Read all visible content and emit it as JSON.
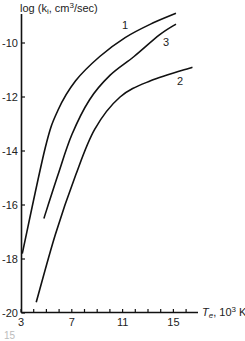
{
  "chart_data": {
    "type": "line",
    "title": "",
    "ylabel": "log (k_i, cm³/sec)",
    "ylabel_parts": {
      "pre": "log (k",
      "sub": "i",
      "mid": ", cm",
      "sup": "3",
      "post": "/sec)"
    },
    "xlabel": "T_e, 10³ K",
    "xlabel_parts": {
      "var": "T",
      "sub": "e",
      "mid": ", 10",
      "sup": "3",
      "post": " K"
    },
    "xlim": [
      3,
      17
    ],
    "ylim": [
      -20,
      -9
    ],
    "x_ticks": [
      3,
      7,
      11,
      15
    ],
    "x_tick_labels": [
      "3",
      "7",
      "11",
      "15"
    ],
    "y_ticks": [
      -10,
      -12,
      -14,
      -16,
      -18,
      -20
    ],
    "y_tick_labels": [
      "-10",
      "-12",
      "-14",
      "-16",
      "-18",
      "-20"
    ],
    "grid": false,
    "legend": "inline curve labels",
    "series": [
      {
        "name": "1",
        "x": [
          3.1,
          4.9,
          5.9,
          7.3,
          9.2,
          11.2,
          13.2,
          15.2
        ],
        "y": [
          -17.8,
          -13.9,
          -12.5,
          -11.4,
          -10.5,
          -9.8,
          -9.3,
          -8.9
        ]
      },
      {
        "name": "3",
        "x": [
          4.8,
          5.9,
          7.0,
          8.4,
          10.0,
          11.9,
          13.9,
          15.2
        ],
        "y": [
          -16.5,
          -14.9,
          -13.4,
          -12.1,
          -11.2,
          -10.5,
          -9.7,
          -9.3
        ]
      },
      {
        "name": "2",
        "x": [
          4.2,
          5.7,
          7.3,
          8.8,
          10.8,
          13.2,
          16.5
        ],
        "y": [
          -19.6,
          -17.1,
          -14.9,
          -13.2,
          -12.0,
          -11.4,
          -10.9
        ]
      }
    ]
  },
  "fragment_text": "15"
}
